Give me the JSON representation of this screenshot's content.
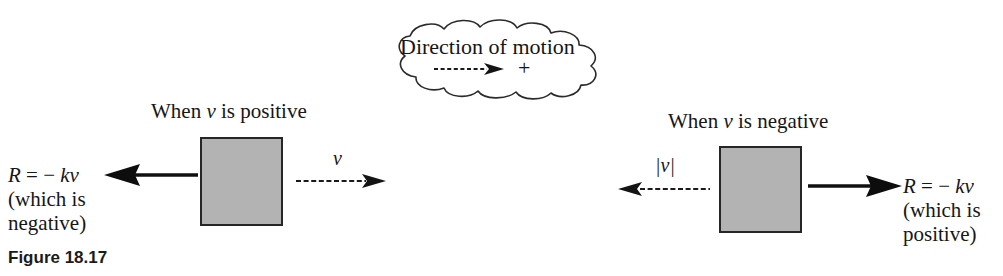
{
  "figure": {
    "caption": "Figure 18.17",
    "background_color": "#ffffff",
    "ink_color": "#161616",
    "block_fill_color": "#b3b3b3",
    "block_border_color": "#262626"
  },
  "callout": {
    "name": "direction-of-motion-cloud",
    "text": "Direction of motion",
    "sign_label": "+",
    "arrow_direction": "right",
    "arrow_style": "dashed"
  },
  "left_case": {
    "heading_prefix": "When ",
    "heading_var": "v",
    "heading_suffix": " is positive",
    "heading_full": "When v is positive",
    "force_line1_prefix": "R",
    "force_line1_eq": " = ",
    "force_line1_minus": "− ",
    "force_line1_k": "k",
    "force_line1_v": "v",
    "force_line1_full": "R = − kv",
    "force_line2": "(which is",
    "force_line3": "negative)",
    "force_arrow_direction": "left",
    "force_arrow_style": "solid-bold",
    "velocity_label": "v",
    "velocity_arrow_direction": "right",
    "velocity_arrow_style": "dashed-thin"
  },
  "right_case": {
    "heading_prefix": "When ",
    "heading_var": "v",
    "heading_suffix": " is negative",
    "heading_full": "When v is negative",
    "force_line1_prefix": "R",
    "force_line1_eq": " = ",
    "force_line1_minus": "− ",
    "force_line1_k": "k",
    "force_line1_v": "v",
    "force_line1_full": "R = − kv",
    "force_line2": "(which is",
    "force_line3": "positive)",
    "force_arrow_direction": "right",
    "force_arrow_style": "solid-bold",
    "velocity_label": "|v|",
    "velocity_label_bar_open": "|",
    "velocity_label_var": "v",
    "velocity_label_bar_close": "|",
    "velocity_arrow_direction": "left",
    "velocity_arrow_style": "dashed-thin"
  }
}
